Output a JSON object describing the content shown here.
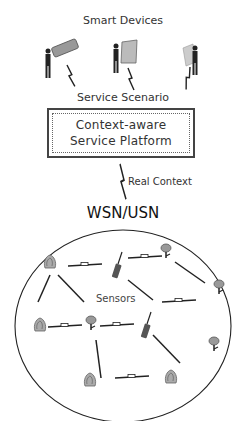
{
  "diagram": {
    "title_top": "Smart Devices",
    "link_label_devices": "Service Scenario",
    "platform": {
      "line1": "Context-aware",
      "line2": "Service Platform"
    },
    "link_label_network": "Real Context",
    "network_label": "WSN/USN",
    "sensor_label": "Sensors",
    "devices": [
      {
        "icon": "person-with-phone-icon"
      },
      {
        "icon": "person-with-tablet-icon"
      },
      {
        "icon": "person-with-pda-icon"
      }
    ],
    "sensor_icons": [
      "fire-sensor-icon",
      "radio-node-icon",
      "camera-sensor-icon",
      "camera-sensor-icon",
      "fire-sensor-icon",
      "camera-sensor-icon",
      "radio-node-icon",
      "camera-sensor-icon",
      "fire-sensor-icon",
      "fire-sensor-icon"
    ],
    "colors": {
      "line": "#222222",
      "box_border": "#444444",
      "icon_gray": "#888888"
    }
  }
}
